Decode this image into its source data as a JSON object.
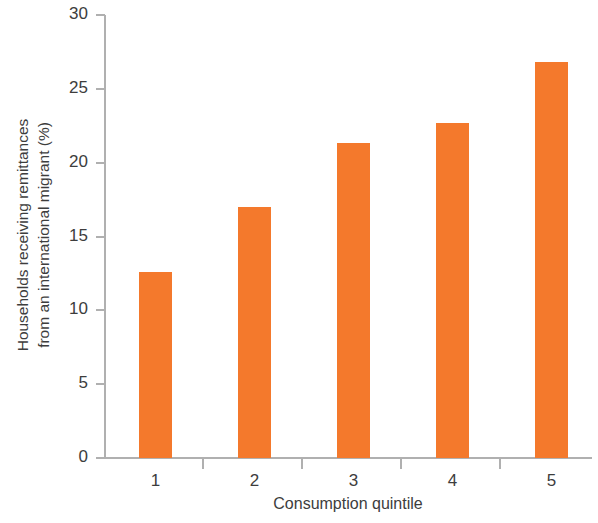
{
  "chart_data": {
    "type": "bar",
    "title": "",
    "xlabel": "Consumption quintile",
    "ylabel": "Households receiving remittances from an international migrant (%)",
    "ylabel_lines": [
      "Households receiving remittances",
      "from an international migrant (%)"
    ],
    "categories": [
      "1",
      "2",
      "3",
      "4",
      "5"
    ],
    "values": [
      12.6,
      17.0,
      21.3,
      22.7,
      26.8
    ],
    "ylim": [
      0,
      30
    ],
    "yticks": [
      0,
      5,
      10,
      15,
      20,
      25,
      30
    ],
    "ytick_labels": [
      "0",
      "5",
      "10",
      "15",
      "20",
      "25",
      "30"
    ],
    "xtick_labels": [
      "1",
      "2",
      "3",
      "4",
      "5"
    ],
    "grid": false,
    "legend": null,
    "bar_color": "#f4792c",
    "axis_color": "#b0b0b0",
    "text_color": "#3d3d3d"
  }
}
